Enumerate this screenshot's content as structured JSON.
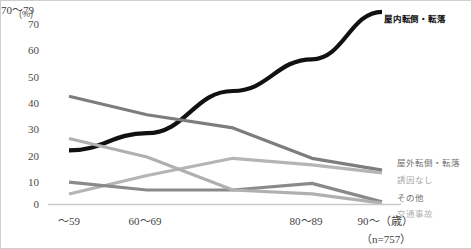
{
  "chart_data": {
    "type": "line",
    "title": "",
    "subtitle": "",
    "xlabel": "",
    "ylabel": "(%)",
    "unit_label": "(%)",
    "categories": [
      "〜59",
      "60〜69",
      "70〜79",
      "80〜89",
      "90〜（歳）"
    ],
    "ylim": [
      0,
      75
    ],
    "yticks": [
      0,
      10,
      20,
      30,
      40,
      50,
      60,
      70
    ],
    "ytick_labels": [
      "0",
      "10",
      "20",
      "30",
      "40",
      "50",
      "60",
      "70"
    ],
    "grid": false,
    "legend_position": "right-inline",
    "sample_size_note": "（n=757）",
    "series": [
      {
        "name": "屋内転倒・転落",
        "color": "#111111",
        "width": 4.2,
        "values": [
          20.5,
          27.0,
          43.0,
          55.0,
          73.0
        ]
      },
      {
        "name": "屋外転倒・転落",
        "color": "#7d7d7d",
        "width": 3.2,
        "values": [
          41.0,
          34.0,
          29.0,
          17.5,
          13.0
        ]
      },
      {
        "name": "誘因なし",
        "color": "#b5b5b5",
        "width": 3.2,
        "values": [
          4.0,
          11.0,
          17.5,
          15.0,
          12.0
        ]
      },
      {
        "name": "その他",
        "color": "#8a8a8a",
        "width": 3.2,
        "values": [
          8.5,
          5.5,
          5.5,
          8.0,
          1.0
        ]
      },
      {
        "name": "交通事故",
        "color": "#b0b0b0",
        "width": 3.2,
        "values": [
          25.0,
          18.0,
          5.5,
          4.0,
          0.5
        ]
      }
    ]
  },
  "labels": {
    "main_series": "屋内転倒・転落",
    "outdoor": "屋外転倒・転落",
    "no_cause": "誘因なし",
    "other": "その他",
    "traffic": "交通事故"
  },
  "axis": {
    "unit": "(%)",
    "y": [
      "70",
      "60",
      "50",
      "40",
      "30",
      "20",
      "10",
      "0"
    ],
    "x": [
      "〜59",
      "60〜69",
      "70〜79",
      "80〜89",
      "90〜（歳）"
    ],
    "n_note": "（n=757）"
  },
  "colors": {
    "main": "#111111",
    "outdoor": "#7d7d7d",
    "no_cause": "#b5b5b5",
    "other": "#8a8a8a",
    "traffic": "#b0b0b0",
    "baseline": "#c9c9c9",
    "border": "#cfcfcf"
  }
}
